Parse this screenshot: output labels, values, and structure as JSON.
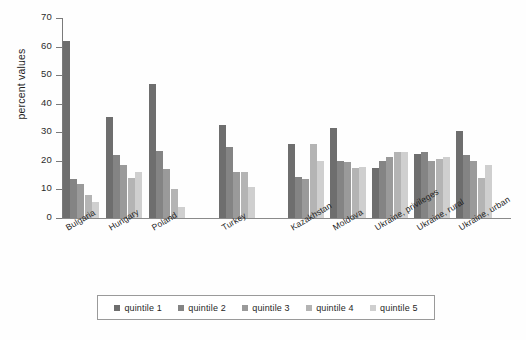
{
  "chart_data": {
    "type": "bar",
    "title": "",
    "subtitle": "",
    "xlabel": "",
    "ylabel": "percent values",
    "ylim": [
      0,
      70
    ],
    "yticks": [
      0,
      10,
      20,
      30,
      40,
      50,
      60,
      70
    ],
    "grid": false,
    "legend_position": "bottom",
    "categories": [
      "Bulgaria",
      "Hungary",
      "Poland",
      "Turkey",
      "Kazakhstan",
      "Moldova",
      "Ukraine, privileges",
      "Ukraine, rural",
      "Ukraine, urban"
    ],
    "series": [
      {
        "name": "quintile 1",
        "color": "#6e6e6e",
        "values": [
          62.0,
          35.5,
          47.0,
          32.5,
          26.0,
          31.5,
          17.5,
          22.5,
          30.5
        ]
      },
      {
        "name": "quintile 2",
        "color": "#848484",
        "values": [
          13.5,
          22.0,
          23.5,
          25.0,
          14.5,
          20.0,
          20.0,
          23.0,
          22.0
        ]
      },
      {
        "name": "quintile 3",
        "color": "#9a9a9a",
        "values": [
          12.0,
          18.5,
          17.0,
          16.0,
          13.5,
          19.5,
          21.5,
          20.0,
          20.0
        ]
      },
      {
        "name": "quintile 4",
        "color": "#b4b4b4",
        "values": [
          8.0,
          14.0,
          10.0,
          16.0,
          26.0,
          17.5,
          23.0,
          20.5,
          14.0
        ]
      },
      {
        "name": "quintile 5",
        "color": "#cfcfcf",
        "values": [
          5.5,
          16.0,
          4.0,
          11.0,
          20.0,
          18.0,
          23.0,
          21.5,
          18.5
        ]
      }
    ]
  },
  "axis": {
    "y_title": "percent values"
  },
  "legend": {
    "items": [
      {
        "label": "quintile 1",
        "color": "#6e6e6e"
      },
      {
        "label": "quintile 2",
        "color": "#848484"
      },
      {
        "label": "quintile 3",
        "color": "#9a9a9a"
      },
      {
        "label": "quintile 4",
        "color": "#b4b4b4"
      },
      {
        "label": "quintile 5",
        "color": "#cfcfcf"
      }
    ]
  }
}
